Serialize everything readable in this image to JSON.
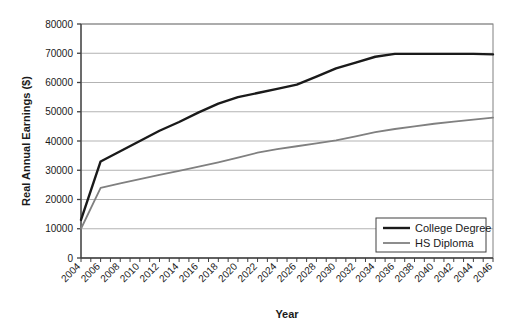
{
  "chart_data": {
    "type": "line",
    "title": "",
    "xlabel": "Year",
    "ylabel": "Real Annual Earnings ($)",
    "xlim": [
      2004,
      2046
    ],
    "ylim": [
      0,
      80000
    ],
    "ytick_step": 10000,
    "ytick_labels": [
      "0",
      "10000",
      "20000",
      "30000",
      "40000",
      "50000",
      "60000",
      "70000",
      "80000"
    ],
    "ytick_values": [
      0,
      10000,
      20000,
      30000,
      40000,
      50000,
      60000,
      70000,
      80000
    ],
    "xtick_labels": [
      "2004",
      "2006",
      "2008",
      "2010",
      "2012",
      "2014",
      "2016",
      "2018",
      "2020",
      "2022",
      "2024",
      "2026",
      "2028",
      "2030",
      "2032",
      "2034",
      "2036",
      "2038",
      "2040",
      "2042",
      "2044",
      "2046"
    ],
    "xtick_values": [
      2004,
      2006,
      2008,
      2010,
      2012,
      2014,
      2016,
      2018,
      2020,
      2022,
      2024,
      2026,
      2028,
      2030,
      2032,
      2034,
      2036,
      2038,
      2040,
      2042,
      2044,
      2046
    ],
    "minor_tick_interval": 1,
    "grid": "horizontal",
    "legend_position": "bottom-right",
    "x": [
      2004,
      2006,
      2008,
      2010,
      2012,
      2014,
      2016,
      2018,
      2020,
      2022,
      2024,
      2026,
      2028,
      2030,
      2032,
      2034,
      2036,
      2038,
      2040,
      2042,
      2044,
      2046
    ],
    "series": [
      {
        "name": "College Degree",
        "color": "#1a1a1a",
        "values": [
          13000,
          33000,
          36500,
          40000,
          43500,
          46500,
          49800,
          52800,
          55000,
          56400,
          57800,
          59300,
          62000,
          64800,
          66800,
          68800,
          69800,
          69800,
          69800,
          69800,
          69800,
          69600
        ]
      },
      {
        "name": "HS Diploma",
        "color": "#808080",
        "values": [
          10000,
          24000,
          25500,
          27000,
          28400,
          29800,
          31200,
          32700,
          34300,
          36000,
          37200,
          38200,
          39200,
          40200,
          41600,
          43000,
          44100,
          45000,
          45900,
          46600,
          47300,
          48000
        ]
      }
    ]
  },
  "legend": {
    "entries": [
      {
        "label": "College Degree"
      },
      {
        "label": "HS Diploma"
      }
    ]
  },
  "axes": {
    "x_title": "Year",
    "y_title": "Real Annual Earnings ($)"
  }
}
